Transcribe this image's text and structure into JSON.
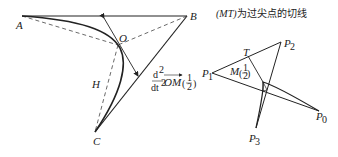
{
  "left_diagram": {
    "points": {
      "A": "A",
      "B": "B",
      "O": "O",
      "C": "C",
      "H": "H"
    },
    "derivative_label": {
      "num": "d",
      "sup_num": "2",
      "den": "dt",
      "sup_den": "2",
      "vec": "OM",
      "arg_num": "1",
      "arg_den": "2"
    }
  },
  "right_diagram": {
    "caption_italic": "(MT)",
    "caption_text": "为过尖点的切线",
    "points": {
      "P0": "P",
      "P0_sub": "0",
      "P1": "P",
      "P1_sub": "1",
      "P2": "P",
      "P2_sub": "2",
      "P3": "P",
      "P3_sub": "3",
      "T": "T",
      "M": "M",
      "M_arg_num": "1",
      "M_arg_den": "2"
    }
  }
}
